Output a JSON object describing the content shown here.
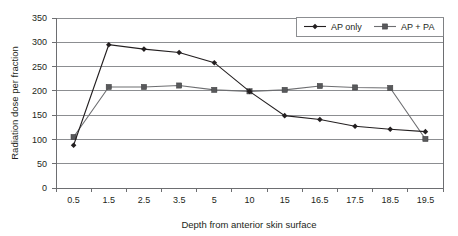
{
  "chart_data": {
    "type": "line",
    "title": "",
    "xlabel": "Depth from anterior skin surface",
    "ylabel": "Radiation dose per fraction",
    "categories": [
      "0.5",
      "1.5",
      "2.5",
      "3.5",
      "5",
      "10",
      "15",
      "16.5",
      "17.5",
      "18.5",
      "19.5"
    ],
    "ylim": [
      0,
      350
    ],
    "yticks": [
      "0",
      "50",
      "100",
      "150",
      "200",
      "250",
      "300",
      "350"
    ],
    "ytick_values": [
      0,
      50,
      100,
      150,
      200,
      250,
      300,
      350
    ],
    "grid": "horizontal",
    "legend_position": "top-right",
    "series": [
      {
        "name": "AP only",
        "marker": "diamond",
        "color": "#231f20",
        "values": [
          88,
          295,
          286,
          279,
          258,
          199,
          149,
          141,
          127,
          121,
          116
        ]
      },
      {
        "name": "AP + PA",
        "marker": "square",
        "color": "#58595b",
        "values": [
          105,
          208,
          208,
          211,
          202,
          199,
          202,
          210,
          207,
          206,
          101
        ]
      }
    ]
  },
  "legend": {
    "entries": [
      {
        "label": "AP only"
      },
      {
        "label": "AP + PA"
      }
    ]
  },
  "icons": {
    "diamond_marker": "diamond-marker-icon",
    "square_marker": "square-marker-icon"
  }
}
